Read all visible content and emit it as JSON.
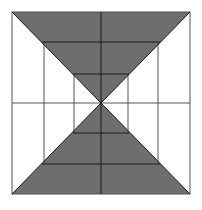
{
  "diagram": {
    "colors": {
      "background": "#ffffff",
      "fill": "#6e6e6e",
      "line": "#1a1a1a",
      "thin_line": "#555555"
    },
    "square": {
      "x1": 12,
      "y1": 12,
      "x2": 190,
      "y2": 194
    },
    "center": {
      "x": 101,
      "y": 103
    }
  }
}
